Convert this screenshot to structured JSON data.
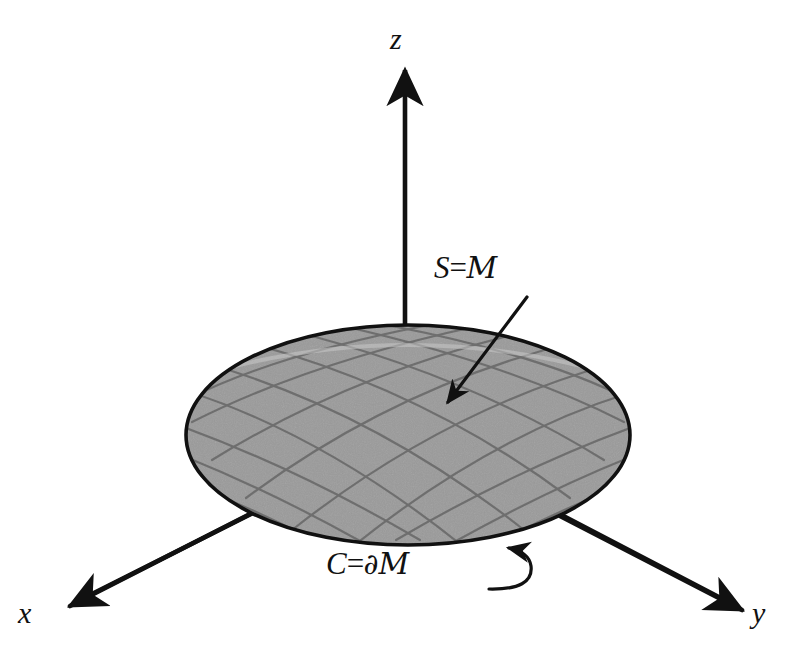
{
  "figure": {
    "background_color": "#ffffff",
    "stroke_color": "#111111",
    "surface_fill_color": "#9a9a9a",
    "surface_grid_color": "#6e6e6e",
    "surface_edge_color": "#111111"
  },
  "axes": [
    {
      "id": "x",
      "label": "x",
      "direction": "down-left",
      "arrow_tip": [
        70,
        606
      ]
    },
    {
      "id": "y",
      "label": "y",
      "direction": "down-right",
      "arrow_tip": [
        742,
        610
      ]
    },
    {
      "id": "z",
      "label": "z",
      "direction": "up",
      "arrow_tip": [
        405,
        72
      ]
    }
  ],
  "surface": {
    "shape": "ellipse",
    "center": [
      408,
      435
    ],
    "radius_x": 222,
    "radius_y": 110,
    "grid": {
      "family_count": 2,
      "lines_per_family": 9
    }
  },
  "annotations": [
    {
      "id": "surface-label",
      "symbol": "S",
      "equals": "=",
      "set": "M",
      "text": "S = M",
      "arrow": "straight",
      "points_to": "surface interior",
      "arrow_tip": [
        447,
        401
      ]
    },
    {
      "id": "boundary-label",
      "symbol": "C",
      "equals": "=",
      "operator": "∂",
      "set": "M",
      "text": "C = ∂M",
      "arrow": "curved-hook",
      "points_to": "surface boundary curve",
      "arrow_tip": [
        508,
        546
      ]
    }
  ]
}
